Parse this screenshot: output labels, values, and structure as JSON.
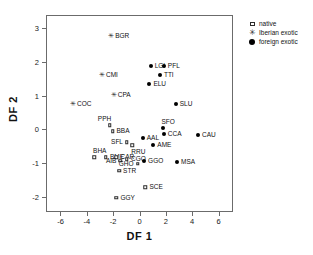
{
  "chart_data": {
    "type": "scatter",
    "title": "",
    "xlabel": "DF 1",
    "ylabel": "DF 2",
    "xlim": [
      -7.1,
      7.1
    ],
    "ylim": [
      -2.45,
      3.4
    ],
    "xticks": [
      -6,
      -4,
      -2,
      0,
      2,
      4,
      6
    ],
    "yticks": [
      3,
      2,
      1,
      0,
      -1,
      -2
    ],
    "grid": false,
    "legend_position": "right-top",
    "series": [
      {
        "name": "native",
        "marker": "square",
        "points": [
          {
            "label": "BBA",
            "x": -2.05,
            "y": -0.05,
            "label_pos": "right"
          },
          {
            "label": "PPH",
            "x": -2.25,
            "y": 0.12,
            "label_pos": "above-left"
          },
          {
            "label": "SFL",
            "x": -0.95,
            "y": -0.38,
            "label_pos": "left"
          },
          {
            "label": "RRU",
            "x": -0.55,
            "y": -0.47,
            "label_pos": "below"
          },
          {
            "label": "BHA",
            "x": -3.45,
            "y": -0.82,
            "label_pos": "above"
          },
          {
            "label": "BME",
            "x": -2.55,
            "y": -0.82,
            "label_pos": "right"
          },
          {
            "label": "CAR",
            "x": -1.75,
            "y": -0.82,
            "label_pos": "right"
          },
          {
            "label": "AIB",
            "x": -1.45,
            "y": -0.93,
            "label_pos": "left"
          },
          {
            "label": "CGO",
            "x": -0.95,
            "y": -0.88,
            "label_pos": "right"
          },
          {
            "label": "GHO",
            "x": -0.15,
            "y": -1.02,
            "label_pos": "left"
          },
          {
            "label": "STR",
            "x": -1.55,
            "y": -1.22,
            "label_pos": "right"
          },
          {
            "label": "SCE",
            "x": 0.45,
            "y": -1.72,
            "label_pos": "right"
          },
          {
            "label": "GGY",
            "x": -1.75,
            "y": -2.02,
            "label_pos": "right"
          }
        ]
      },
      {
        "name": "Iberian exotic",
        "marker": "star",
        "points": [
          {
            "label": "BGR",
            "x": -2.15,
            "y": 2.78,
            "label_pos": "right"
          },
          {
            "label": "CMI",
            "x": -2.85,
            "y": 1.62,
            "label_pos": "right"
          },
          {
            "label": "CPA",
            "x": -1.95,
            "y": 1.02,
            "label_pos": "right"
          },
          {
            "label": "COC",
            "x": -5.05,
            "y": 0.75,
            "label_pos": "right"
          }
        ]
      },
      {
        "name": "foreign exotic",
        "marker": "circle",
        "points": [
          {
            "label": "LGI",
            "x": 0.85,
            "y": 1.88,
            "label_pos": "right"
          },
          {
            "label": "PFL",
            "x": 1.85,
            "y": 1.88,
            "label_pos": "right"
          },
          {
            "label": "TTI",
            "x": 1.55,
            "y": 1.62,
            "label_pos": "right"
          },
          {
            "label": "ELU",
            "x": 0.75,
            "y": 1.34,
            "label_pos": "right"
          },
          {
            "label": "SLU",
            "x": 2.75,
            "y": 0.75,
            "label_pos": "right"
          },
          {
            "label": "SFO",
            "x": 1.75,
            "y": 0.05,
            "label_pos": "above"
          },
          {
            "label": "CCA",
            "x": 1.85,
            "y": -0.13,
            "label_pos": "right"
          },
          {
            "label": "CAU",
            "x": 4.45,
            "y": -0.17,
            "label_pos": "right"
          },
          {
            "label": "AAL",
            "x": 0.25,
            "y": -0.24,
            "label_pos": "right"
          },
          {
            "label": "AME",
            "x": 1.05,
            "y": -0.47,
            "label_pos": "right"
          },
          {
            "label": "GGO",
            "x": 0.35,
            "y": -0.95,
            "label_pos": "right"
          },
          {
            "label": "MSA",
            "x": 2.85,
            "y": -0.98,
            "label_pos": "right"
          }
        ]
      }
    ]
  },
  "legend": {
    "items": [
      {
        "label": "native",
        "glyph": "square-icon"
      },
      {
        "label": "Iberian exotic",
        "glyph": "star-icon"
      },
      {
        "label": "foreign exotic",
        "glyph": "filled-circle-icon"
      }
    ]
  }
}
